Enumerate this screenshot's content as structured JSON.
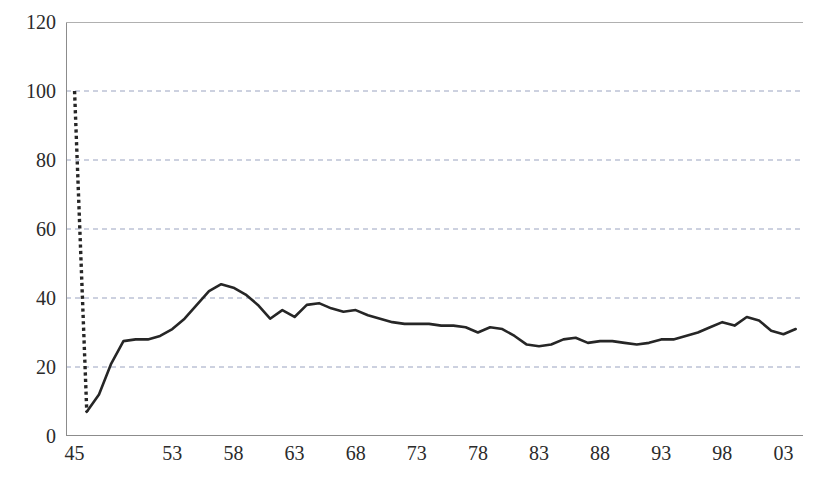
{
  "chart_data": {
    "type": "line",
    "title": "",
    "subtitle": "",
    "xlabel": "",
    "ylabel": "",
    "xlim": [
      1944.3,
      2004.6
    ],
    "ylim": [
      0,
      120
    ],
    "grid": true,
    "grid_axis": "y",
    "legend": false,
    "legend_position": "none",
    "line_color": "#262626",
    "grid_color": "#9aa3c0",
    "axis_color": "#8c8c8c",
    "y_ticks": [
      0,
      20,
      40,
      60,
      80,
      100,
      120
    ],
    "y_tick_labels": [
      "0",
      "20",
      "40",
      "60",
      "80",
      "100",
      "120"
    ],
    "x_tick_labels": [
      "45",
      "53",
      "58",
      "63",
      "68",
      "73",
      "78",
      "83",
      "88",
      "93",
      "98",
      "03"
    ],
    "x_tick_values": [
      1945,
      1953,
      1958,
      1963,
      1968,
      1973,
      1978,
      1983,
      1988,
      1993,
      1998,
      2003
    ],
    "x_minor_tick_step": 1,
    "series": [
      {
        "name": "dotted-segment",
        "style": "dotted",
        "x": [
          1945,
          1946
        ],
        "values": [
          100,
          7
        ]
      },
      {
        "name": "solid-segment",
        "style": "solid",
        "x": [
          1946,
          1947,
          1948,
          1949,
          1950,
          1951,
          1952,
          1953,
          1954,
          1955,
          1956,
          1957,
          1958,
          1959,
          1960,
          1961,
          1962,
          1963,
          1964,
          1965,
          1966,
          1967,
          1968,
          1969,
          1970,
          1971,
          1972,
          1973,
          1974,
          1975,
          1976,
          1977,
          1978,
          1979,
          1980,
          1981,
          1982,
          1983,
          1984,
          1985,
          1986,
          1987,
          1988,
          1989,
          1990,
          1991,
          1992,
          1993,
          1994,
          1995,
          1996,
          1997,
          1998,
          1999,
          2000,
          2001,
          2002,
          2003,
          2004
        ],
        "values": [
          7,
          12,
          21,
          27.5,
          28,
          28,
          29,
          31,
          34,
          38,
          42,
          44,
          43,
          41,
          38,
          34,
          36.5,
          34.5,
          38,
          38.5,
          37,
          36,
          36.5,
          35,
          34,
          33,
          32.5,
          32.5,
          32.5,
          32,
          32,
          31.5,
          30,
          31.5,
          31,
          29,
          26.5,
          26,
          26.5,
          28,
          28.5,
          27,
          27.5,
          27.5,
          27,
          26.5,
          27,
          28,
          28,
          29,
          30,
          31.5,
          33,
          32,
          34.5,
          33.5,
          30.5,
          29.5,
          31
        ]
      }
    ]
  },
  "yaxis": {
    "labels": [
      "120",
      "100",
      "80",
      "60",
      "40",
      "20",
      "0"
    ]
  },
  "xaxis": {
    "labels": [
      "45",
      "53",
      "58",
      "63",
      "68",
      "73",
      "78",
      "83",
      "88",
      "93",
      "98",
      "03"
    ]
  },
  "cropped_text": {
    "top": "",
    "bottom": ""
  }
}
